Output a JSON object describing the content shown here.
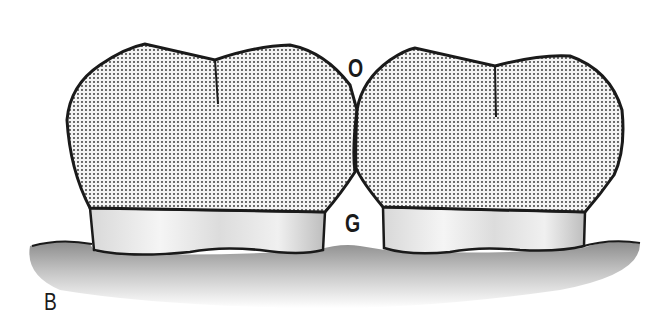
{
  "figure": {
    "panel_label": "B",
    "labels": {
      "occlusal": "O",
      "gingival": "G"
    },
    "colors": {
      "outline": "#1a1a1a",
      "crown_dots": "#555555",
      "crown_bg": "#f2f2f2",
      "root_band": "#e6e6e6",
      "gum_shade": "#9a9a9a"
    }
  }
}
